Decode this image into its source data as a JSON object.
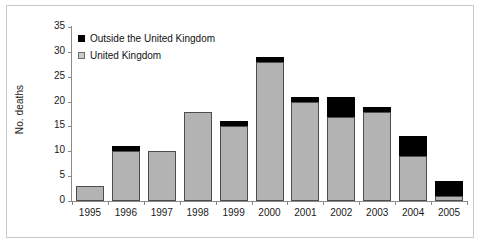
{
  "chart_data": {
    "type": "bar",
    "title": "",
    "subtitle": "",
    "xlabel": "",
    "ylabel": "No. deaths",
    "stacked": true,
    "grid": false,
    "legend_position": "top-left",
    "categories": [
      "1995",
      "1996",
      "1997",
      "1998",
      "1999",
      "2000",
      "2001",
      "2002",
      "2003",
      "2004",
      "2005"
    ],
    "ylim": [
      0,
      35
    ],
    "yticks": [
      0,
      5,
      10,
      15,
      20,
      25,
      30,
      35
    ],
    "series": [
      {
        "name": "United Kingdom",
        "color": "#b3b3b3",
        "values": [
          3,
          10,
          10,
          18,
          15,
          28,
          20,
          17,
          18,
          9,
          1
        ]
      },
      {
        "name": "Outside the United Kingdom",
        "color": "#000000",
        "values": [
          0,
          1,
          0,
          0,
          1,
          1,
          1,
          4,
          1,
          4,
          3
        ]
      }
    ],
    "totals": [
      3,
      11,
      10,
      18,
      16,
      29,
      21,
      21,
      19,
      13,
      4
    ]
  },
  "legend": {
    "items": [
      {
        "label": "Outside the United Kingdom",
        "marker": "filled-square-black"
      },
      {
        "label": "United Kingdom",
        "marker": "filled-square-gray"
      }
    ]
  },
  "axes": {
    "y_label": "No. deaths",
    "y_tick_labels": [
      "35",
      "30",
      "25",
      "20",
      "15",
      "10",
      "5",
      "0"
    ],
    "x_tick_labels": [
      "1995",
      "1996",
      "1997",
      "1998",
      "1999",
      "2000",
      "2001",
      "2002",
      "2003",
      "2004",
      "2005"
    ]
  },
  "colors": {
    "uk_fill": "#b3b3b3",
    "outside_fill": "#000000",
    "bar_stroke": "#4d4d4d",
    "axis": "#8a8a8a",
    "frame": "#c8c8c8",
    "text": "#1a1a1a",
    "background": "#ffffff"
  }
}
